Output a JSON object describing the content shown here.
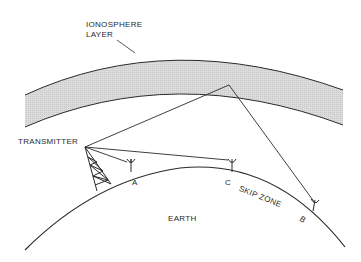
{
  "diagram": {
    "labels": {
      "ionosphere_line1": "IONOSPHERE",
      "ionosphere_line2": "LAYER",
      "transmitter": "TRANSMITTER",
      "receiver_a": "A",
      "receiver_b": "B",
      "receiver_c": "C",
      "skip_zone": "SKIP ZONE",
      "earth": "EARTH"
    },
    "colors": {
      "line": "#2a2a2a",
      "ionosphere_fill": "#d9d9d9",
      "background": "#ffffff"
    }
  }
}
